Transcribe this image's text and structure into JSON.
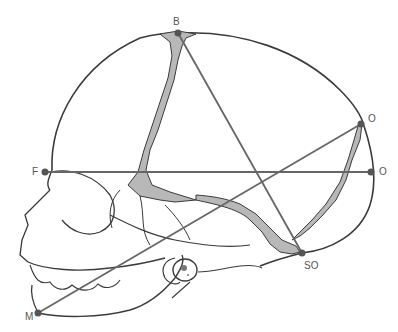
{
  "diagram": {
    "colors": {
      "outline": "#3a3a3a",
      "measure_line": "#666666",
      "fontanelle_fill": "#b8b8b8",
      "point": "#555555",
      "label": "#555555"
    },
    "points": [
      {
        "id": "B",
        "label": "B",
        "x": 178,
        "y": 33
      },
      {
        "id": "O_upper",
        "label": "O",
        "x": 361,
        "y": 124
      },
      {
        "id": "O_lower",
        "label": "O",
        "x": 371,
        "y": 172
      },
      {
        "id": "F",
        "label": "F",
        "x": 45,
        "y": 172
      },
      {
        "id": "SO",
        "label": "SO",
        "x": 302,
        "y": 253
      },
      {
        "id": "M",
        "label": "M",
        "x": 38,
        "y": 313
      }
    ],
    "lines": [
      {
        "name": "B-SO",
        "from": "B",
        "to": "SO"
      },
      {
        "name": "F-O",
        "from": "F",
        "to": "O_lower"
      },
      {
        "name": "M-O",
        "from": "M",
        "to": "O_upper"
      }
    ]
  }
}
